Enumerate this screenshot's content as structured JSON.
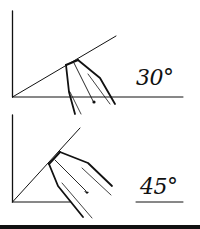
{
  "diagram": {
    "panels": [
      {
        "id": "top",
        "angle_label": "30°",
        "angle_degrees": 30
      },
      {
        "id": "bottom",
        "angle_label": "45°",
        "angle_degrees": 45
      }
    ],
    "colors": {
      "ink": "#111111",
      "background": "#ffffff"
    }
  }
}
